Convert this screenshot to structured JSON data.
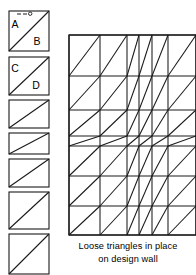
{
  "figure": {
    "caption_lines": [
      "Loose triangles in place",
      "on design wall"
    ],
    "stroke_color": "#1a1a1a",
    "background_color": "#ffffff"
  },
  "swatch_column": {
    "label": "Half-square triangle units",
    "units": [
      {
        "id": "unit-1",
        "x": 9,
        "y": 11,
        "width": 40,
        "height": 40,
        "diagonal": "bottom-left-to-top-right",
        "letters": [
          {
            "text": "A",
            "x": 15,
            "y": 28
          },
          {
            "text": "B",
            "x": 37,
            "y": 45
          }
        ],
        "has_pin": true,
        "pin": {
          "x": 29,
          "y": 14
        }
      },
      {
        "id": "unit-2",
        "x": 9,
        "y": 57,
        "width": 40,
        "height": 38,
        "diagonal": "bottom-left-to-top-right",
        "letters": [
          {
            "text": "C",
            "x": 15,
            "y": 72
          },
          {
            "text": "D",
            "x": 36,
            "y": 89
          }
        ],
        "has_pin": false
      },
      {
        "id": "unit-3",
        "x": 9,
        "y": 100,
        "width": 40,
        "height": 28,
        "diagonal": "bottom-left-to-top-right",
        "letters": [],
        "has_pin": false
      },
      {
        "id": "unit-4",
        "x": 9,
        "y": 133,
        "width": 40,
        "height": 21,
        "diagonal": "bottom-left-to-top-right",
        "letters": [],
        "has_pin": false
      },
      {
        "id": "unit-5",
        "x": 9,
        "y": 159,
        "width": 40,
        "height": 28,
        "diagonal": "bottom-left-to-top-right",
        "letters": [],
        "has_pin": false
      },
      {
        "id": "unit-6",
        "x": 9,
        "y": 192,
        "width": 40,
        "height": 37,
        "diagonal": "bottom-left-to-top-right",
        "letters": [],
        "has_pin": false
      },
      {
        "id": "unit-7",
        "x": 9,
        "y": 234,
        "width": 40,
        "height": 40,
        "diagonal": "bottom-left-to-top-right",
        "letters": [],
        "has_pin": false
      }
    ]
  },
  "design_wall": {
    "label": "Design wall grid",
    "bounds": {
      "x": 69,
      "y": 35,
      "width": 127,
      "height": 200
    },
    "column_edges": [
      69,
      100,
      127,
      139,
      152,
      168,
      196
    ],
    "row_edges": [
      35,
      76,
      110,
      136,
      146,
      176,
      206,
      235
    ],
    "cells": [
      {
        "row": 0,
        "col": 0,
        "diagonal": "bottom-left-to-top-right"
      },
      {
        "row": 0,
        "col": 1,
        "diagonal": "bottom-left-to-top-right"
      },
      {
        "row": 0,
        "col": 2,
        "diagonal": "bottom-left-to-top-right"
      },
      {
        "row": 0,
        "col": 3,
        "diagonal": "bottom-left-to-top-right"
      },
      {
        "row": 0,
        "col": 4,
        "diagonal": "bottom-left-to-top-right"
      },
      {
        "row": 0,
        "col": 5,
        "diagonal": "bottom-left-to-top-right"
      },
      {
        "row": 1,
        "col": 0,
        "diagonal": "bottom-left-to-top-right"
      },
      {
        "row": 1,
        "col": 1,
        "diagonal": "bottom-left-to-top-right"
      },
      {
        "row": 1,
        "col": 2,
        "diagonal": "bottom-left-to-top-right"
      },
      {
        "row": 1,
        "col": 3,
        "diagonal": "bottom-left-to-top-right"
      },
      {
        "row": 1,
        "col": 4,
        "diagonal": "bottom-left-to-top-right"
      },
      {
        "row": 1,
        "col": 5,
        "diagonal": "bottom-left-to-top-right"
      },
      {
        "row": 2,
        "col": 0,
        "diagonal": "bottom-left-to-top-right"
      },
      {
        "row": 2,
        "col": 1,
        "diagonal": "bottom-left-to-top-right"
      },
      {
        "row": 2,
        "col": 2,
        "diagonal": "bottom-left-to-top-right"
      },
      {
        "row": 2,
        "col": 3,
        "diagonal": "bottom-left-to-top-right"
      },
      {
        "row": 2,
        "col": 4,
        "diagonal": "bottom-left-to-top-right"
      },
      {
        "row": 2,
        "col": 5,
        "diagonal": "bottom-left-to-top-right"
      },
      {
        "row": 3,
        "col": 0,
        "diagonal": "bottom-left-to-top-right"
      },
      {
        "row": 3,
        "col": 1,
        "diagonal": "bottom-left-to-top-right"
      },
      {
        "row": 3,
        "col": 2,
        "diagonal": "bottom-left-to-top-right"
      },
      {
        "row": 3,
        "col": 3,
        "diagonal": "bottom-left-to-top-right"
      },
      {
        "row": 3,
        "col": 4,
        "diagonal": "bottom-left-to-top-right"
      },
      {
        "row": 3,
        "col": 5,
        "diagonal": "bottom-left-to-top-right"
      },
      {
        "row": 4,
        "col": 0,
        "diagonal": "bottom-left-to-top-right"
      },
      {
        "row": 4,
        "col": 1,
        "diagonal": "bottom-left-to-top-right"
      },
      {
        "row": 4,
        "col": 2,
        "diagonal": "bottom-left-to-top-right"
      },
      {
        "row": 4,
        "col": 3,
        "diagonal": "bottom-left-to-top-right"
      },
      {
        "row": 4,
        "col": 4,
        "diagonal": "bottom-left-to-top-right"
      },
      {
        "row": 4,
        "col": 5,
        "diagonal": "bottom-left-to-top-right"
      },
      {
        "row": 5,
        "col": 0,
        "diagonal": "bottom-left-to-top-right"
      },
      {
        "row": 5,
        "col": 1,
        "diagonal": "bottom-left-to-top-right"
      },
      {
        "row": 5,
        "col": 2,
        "diagonal": "bottom-left-to-top-right"
      },
      {
        "row": 5,
        "col": 3,
        "diagonal": "bottom-left-to-top-right"
      },
      {
        "row": 5,
        "col": 4,
        "diagonal": "bottom-left-to-top-right"
      },
      {
        "row": 5,
        "col": 5,
        "diagonal": "bottom-left-to-top-right"
      },
      {
        "row": 6,
        "col": 0,
        "diagonal": "bottom-left-to-top-right"
      },
      {
        "row": 6,
        "col": 1,
        "diagonal": "bottom-left-to-top-right"
      },
      {
        "row": 6,
        "col": 2,
        "diagonal": "bottom-left-to-top-right"
      },
      {
        "row": 6,
        "col": 3,
        "diagonal": "bottom-left-to-top-right"
      },
      {
        "row": 6,
        "col": 4,
        "diagonal": "bottom-left-to-top-right"
      },
      {
        "row": 6,
        "col": 5,
        "diagonal": "bottom-left-to-top-right"
      }
    ]
  }
}
